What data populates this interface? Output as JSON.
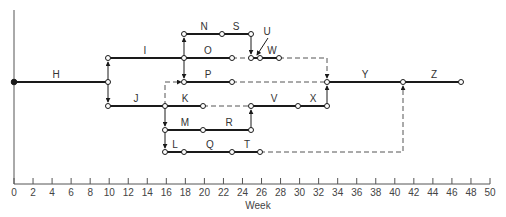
{
  "axis": {
    "label": "Week",
    "min": 0,
    "max": 50,
    "step": 2,
    "ticks": [
      "0",
      "2",
      "4",
      "6",
      "8",
      "10",
      "12",
      "14",
      "16",
      "18",
      "20",
      "22",
      "24",
      "26",
      "28",
      "30",
      "32",
      "34",
      "36",
      "38",
      "40",
      "42",
      "44",
      "46",
      "48",
      "50"
    ]
  },
  "activities": [
    {
      "id": "H",
      "start": 0,
      "end": 10,
      "row": "main"
    },
    {
      "id": "I",
      "start": 10,
      "end": 18,
      "row": "upper"
    },
    {
      "id": "J",
      "start": 10,
      "end": 16,
      "row": "lower"
    },
    {
      "id": "N",
      "start": 18,
      "end": 22,
      "row": "top"
    },
    {
      "id": "S",
      "start": 22,
      "end": 25,
      "row": "top"
    },
    {
      "id": "O",
      "start": 18,
      "end": 23,
      "row": "upper"
    },
    {
      "id": "U",
      "start": 25,
      "end": 26,
      "row": "upper"
    },
    {
      "id": "W",
      "start": 26,
      "end": 28,
      "row": "upper"
    },
    {
      "id": "P",
      "start": 18,
      "end": 23,
      "row": "main"
    },
    {
      "id": "K",
      "start": 16,
      "end": 20,
      "row": "lower"
    },
    {
      "id": "V",
      "start": 25,
      "end": 30,
      "row": "lower"
    },
    {
      "id": "X",
      "start": 30,
      "end": 33,
      "row": "lower"
    },
    {
      "id": "M",
      "start": 16,
      "end": 20,
      "row": "lower2"
    },
    {
      "id": "R",
      "start": 20,
      "end": 25,
      "row": "lower2"
    },
    {
      "id": "L",
      "start": 16,
      "end": 18,
      "row": "bottom"
    },
    {
      "id": "Q",
      "start": 18,
      "end": 23,
      "row": "bottom"
    },
    {
      "id": "T",
      "start": 23,
      "end": 26,
      "row": "bottom"
    },
    {
      "id": "Y",
      "start": 33,
      "end": 41,
      "row": "main"
    },
    {
      "id": "Z",
      "start": 41,
      "end": 47,
      "row": "main"
    }
  ],
  "labels": {
    "H": "H",
    "I": "I",
    "J": "J",
    "N": "N",
    "S": "S",
    "O": "O",
    "U": "U",
    "W": "W",
    "P": "P",
    "K": "K",
    "V": "V",
    "X": "X",
    "M": "M",
    "R": "R",
    "L": "L",
    "Q": "Q",
    "T": "T",
    "Y": "Y",
    "Z": "Z"
  },
  "colors": {
    "line": "#1a1a1a",
    "dash": "#555555",
    "axis": "#555555",
    "text": "#333333"
  }
}
